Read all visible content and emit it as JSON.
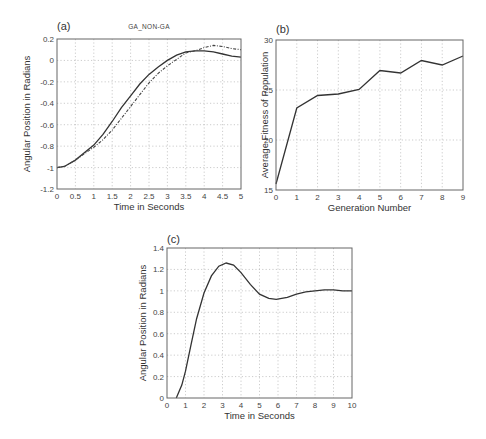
{
  "chart_data": [
    {
      "id": "a",
      "type": "line",
      "panel_label": "(a)",
      "title": "GA_NON-GA",
      "xlabel": "Time in Seconds",
      "ylabel": "Angular Position in Radians",
      "xlim": [
        0,
        5
      ],
      "ylim": [
        -1.2,
        0.2
      ],
      "xticks": [
        "0",
        "0.5",
        "1",
        "1.5",
        "2",
        "2.5",
        "3",
        "3.5",
        "4",
        "4.5",
        "5"
      ],
      "yticks": [
        "0.2",
        "0",
        "-0.2",
        "-0.4",
        "-0.6",
        "-0.8",
        "-1",
        "-1.2"
      ],
      "grid": true,
      "series": [
        {
          "name": "GA",
          "style": "solid",
          "x": [
            0,
            0.2,
            0.5,
            0.75,
            1.0,
            1.25,
            1.5,
            1.75,
            2.0,
            2.25,
            2.5,
            2.75,
            3.0,
            3.25,
            3.5,
            3.75,
            4.0,
            4.25,
            4.5,
            4.75,
            5.0
          ],
          "y": [
            -1.0,
            -0.99,
            -0.93,
            -0.86,
            -0.79,
            -0.69,
            -0.57,
            -0.44,
            -0.33,
            -0.22,
            -0.13,
            -0.06,
            0.0,
            0.05,
            0.08,
            0.09,
            0.09,
            0.08,
            0.06,
            0.04,
            0.03
          ]
        },
        {
          "name": "NON-GA",
          "style": "dash-dot",
          "x": [
            0,
            0.2,
            0.5,
            0.75,
            1.0,
            1.25,
            1.5,
            1.75,
            2.0,
            2.25,
            2.5,
            2.75,
            3.0,
            3.25,
            3.5,
            3.75,
            4.0,
            4.25,
            4.5,
            4.75,
            5.0
          ],
          "y": [
            -1.0,
            -0.99,
            -0.93,
            -0.87,
            -0.81,
            -0.74,
            -0.65,
            -0.54,
            -0.43,
            -0.32,
            -0.21,
            -0.12,
            -0.05,
            0.01,
            0.07,
            0.09,
            0.12,
            0.14,
            0.13,
            0.11,
            0.1
          ]
        }
      ]
    },
    {
      "id": "b",
      "type": "line",
      "panel_label": "(b)",
      "title": "",
      "xlabel": "Generation Number",
      "ylabel": "Average Fitness of Population",
      "xlim": [
        0,
        9
      ],
      "ylim": [
        15,
        30
      ],
      "xticks": [
        "0",
        "1",
        "2",
        "3",
        "4",
        "5",
        "6",
        "7",
        "8",
        "9"
      ],
      "yticks": [
        "30",
        "25",
        "20",
        "15"
      ],
      "grid": true,
      "series": [
        {
          "name": "Average Fitness",
          "style": "solid",
          "x": [
            0,
            1,
            2,
            3,
            4,
            5,
            6,
            7,
            8,
            9
          ],
          "y": [
            15.6,
            23.2,
            24.45,
            24.6,
            25.05,
            26.95,
            26.7,
            27.95,
            27.5,
            28.4
          ]
        }
      ]
    },
    {
      "id": "c",
      "type": "line",
      "panel_label": "(c)",
      "title": "",
      "xlabel": "Time in Seconds",
      "ylabel": "Angular Position in Radians",
      "xlim": [
        0,
        10
      ],
      "ylim": [
        0,
        1.4
      ],
      "xticks": [
        "0",
        "1",
        "2",
        "3",
        "4",
        "5",
        "6",
        "7",
        "8",
        "9",
        "10"
      ],
      "yticks": [
        "1.4",
        "1.2",
        "1",
        "0.8",
        "0.6",
        "0.4",
        "0.2",
        "0"
      ],
      "grid": true,
      "series": [
        {
          "name": "Response",
          "style": "solid",
          "x": [
            0.5,
            0.8,
            1.0,
            1.3,
            1.6,
            2.0,
            2.4,
            2.8,
            3.2,
            3.6,
            4.0,
            4.5,
            5.0,
            5.5,
            5.9,
            6.5,
            7.0,
            7.5,
            8.0,
            8.5,
            9.0,
            9.5,
            10.0
          ],
          "y": [
            0.0,
            0.12,
            0.25,
            0.5,
            0.74,
            0.98,
            1.14,
            1.23,
            1.26,
            1.24,
            1.17,
            1.06,
            0.97,
            0.93,
            0.92,
            0.94,
            0.97,
            0.99,
            1.0,
            1.01,
            1.01,
            1.0,
            1.0
          ]
        }
      ]
    }
  ]
}
